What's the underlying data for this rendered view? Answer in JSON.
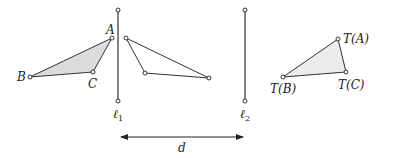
{
  "diagram": {
    "colors": {
      "stroke": "#333333",
      "fill_shaded": "#dcdcdc",
      "fill_light": "#ececec",
      "background": "#ffffff"
    },
    "lines": [
      {
        "name": "l1",
        "label": "ℓ",
        "subscript": "1"
      },
      {
        "name": "l2",
        "label": "ℓ",
        "subscript": "2"
      }
    ],
    "original_triangle": {
      "vertices": [
        {
          "id": "A",
          "label": "A"
        },
        {
          "id": "B",
          "label": "B"
        },
        {
          "id": "C",
          "label": "C"
        }
      ],
      "shaded": true
    },
    "reflected_triangle": {
      "vertices": [
        {
          "id": "A1",
          "label": ""
        },
        {
          "id": "B1",
          "label": ""
        },
        {
          "id": "C1",
          "label": ""
        }
      ],
      "shaded": false
    },
    "translated_triangle": {
      "vertices": [
        {
          "id": "TA",
          "label": "T(A)"
        },
        {
          "id": "TB",
          "label": "T(B)"
        },
        {
          "id": "TC",
          "label": "T(C)"
        }
      ],
      "shaded": true
    },
    "distance_arrow": {
      "label": "d"
    }
  }
}
